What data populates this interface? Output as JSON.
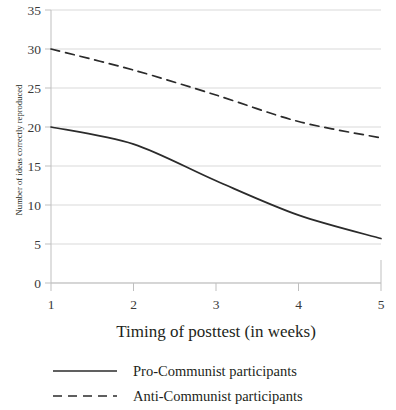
{
  "chart_data": {
    "type": "line",
    "title": "",
    "xlabel": "Timing of posttest (in weeks)",
    "ylabel": "Number of ideas correctly reproduced",
    "x": [
      1,
      2,
      3,
      4,
      5
    ],
    "xtick_labels": [
      "1",
      "2",
      "3",
      "4",
      "5"
    ],
    "ytick_labels": [
      "0",
      "5",
      "10",
      "15",
      "20",
      "25",
      "30",
      "35"
    ],
    "xlim": [
      1,
      5
    ],
    "ylim": [
      0,
      35
    ],
    "ytick_step": 5,
    "grid": "horizontal",
    "legend_position": "bottom",
    "series": [
      {
        "name": "Pro-Communist participants",
        "style": "solid",
        "color": "#2b2b2b",
        "values": [
          20.0,
          17.8,
          13.1,
          8.7,
          5.7
        ]
      },
      {
        "name": "Anti-Communist participants",
        "style": "dashed",
        "color": "#2b2b2b",
        "values": [
          30.0,
          27.3,
          24.1,
          20.7,
          18.6
        ]
      }
    ]
  },
  "axes": {
    "y_title": "Number of ideas correctly reproduced",
    "x_title": "Timing of posttest (in weeks)",
    "y_ticks": [
      "35",
      "30",
      "25",
      "20",
      "15",
      "10",
      "5",
      "0"
    ],
    "x_ticks": [
      "1",
      "2",
      "3",
      "4",
      "5"
    ]
  },
  "legend": {
    "items": [
      {
        "label": "Pro-Communist participants",
        "style": "solid"
      },
      {
        "label": "Anti-Communist participants",
        "style": "dashed"
      }
    ]
  },
  "colors": {
    "line": "#2b2b2b",
    "grid": "#d9d9d9",
    "axis": "#bfbfbf",
    "text": "#231f20",
    "background": "#ffffff"
  }
}
